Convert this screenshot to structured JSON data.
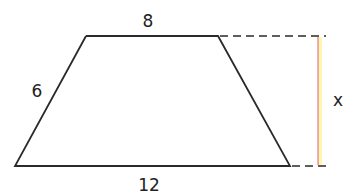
{
  "diagram": {
    "shape": "trapezoid",
    "labels": {
      "top": "8",
      "left": "6",
      "bottom": "12",
      "height": "x"
    },
    "colors": {
      "stroke": "#2a2a2a",
      "height_line": "#e07a8a",
      "height_glow": "#fff6b0"
    }
  }
}
